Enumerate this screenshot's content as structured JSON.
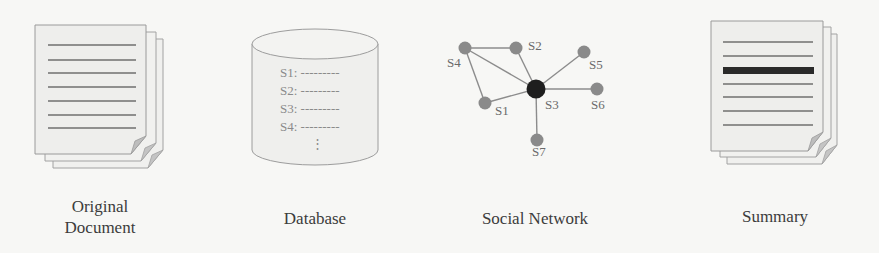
{
  "diagram": {
    "type": "pipeline",
    "stages": [
      {
        "id": "original-document",
        "label_line1": "Original",
        "label_line2": "Document",
        "icon": "document-stack-icon"
      },
      {
        "id": "database",
        "label": "Database",
        "icon": "database-cylinder-icon",
        "rows": [
          "S1: ---------",
          "S2: ---------",
          "S3: ---------",
          "S4: ---------"
        ],
        "ellipsis": "⋮"
      },
      {
        "id": "social-network",
        "label": "Social Network",
        "icon": "network-graph-icon"
      },
      {
        "id": "summary",
        "label": "Summary",
        "icon": "summary-document-stack-icon"
      }
    ],
    "network": {
      "nodes": [
        {
          "id": "S1",
          "label": "S1",
          "x": 485,
          "y": 103,
          "central": false
        },
        {
          "id": "S2",
          "label": "S2",
          "x": 516,
          "y": 48,
          "central": false
        },
        {
          "id": "S3",
          "label": "S3",
          "x": 536,
          "y": 89,
          "central": true
        },
        {
          "id": "S4",
          "label": "S4",
          "x": 465,
          "y": 48,
          "central": false
        },
        {
          "id": "S5",
          "label": "S5",
          "x": 584,
          "y": 52,
          "central": false
        },
        {
          "id": "S6",
          "label": "S6",
          "x": 597,
          "y": 89,
          "central": false
        },
        {
          "id": "S7",
          "label": "S7",
          "x": 537,
          "y": 140,
          "central": false
        }
      ],
      "edges": [
        [
          "S4",
          "S2"
        ],
        [
          "S4",
          "S3"
        ],
        [
          "S4",
          "S1"
        ],
        [
          "S2",
          "S3"
        ],
        [
          "S1",
          "S3"
        ],
        [
          "S3",
          "S5"
        ],
        [
          "S3",
          "S6"
        ],
        [
          "S3",
          "S7"
        ]
      ]
    },
    "colors": {
      "page_fill": "#eeeeec",
      "page_stroke": "#9a9a9a",
      "text_line": "#6f6f6f",
      "highlight_line": "#2a2a2a",
      "node": "#8a8a8a",
      "central_node": "#1e1e1e",
      "edge": "#8c8c8c"
    }
  }
}
